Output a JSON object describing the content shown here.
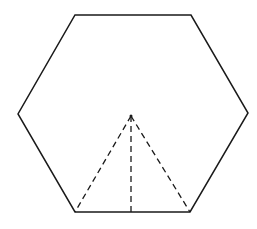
{
  "diagram": {
    "type": "geometry",
    "colors": {
      "background": "#ffffff",
      "stroke": "#1a1a1a"
    },
    "hexagon": {
      "vertices": [
        [
          75,
          15
        ],
        [
          191,
          15
        ],
        [
          248,
          113
        ],
        [
          190,
          212
        ],
        [
          75,
          212
        ],
        [
          18,
          114
        ]
      ],
      "stroke_width": 1.5
    },
    "apex": [
      131,
      116
    ],
    "dashed_segments": [
      {
        "from": [
          131,
          116
        ],
        "to": [
          75,
          212
        ]
      },
      {
        "from": [
          131,
          116
        ],
        "to": [
          131,
          212
        ]
      },
      {
        "from": [
          131,
          116
        ],
        "to": [
          190,
          212
        ]
      }
    ],
    "dash_pattern": "6 4",
    "labels": []
  }
}
